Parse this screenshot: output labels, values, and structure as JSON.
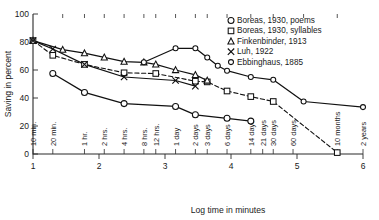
{
  "chart_data": {
    "type": "line",
    "title": "",
    "xlabel": "Log time in minutes",
    "ylabel": "Saving in percent",
    "xlim": [
      1,
      6
    ],
    "ylim": [
      0,
      100
    ],
    "grid": false,
    "legend_position": "top-right",
    "y_ticks": [
      0,
      20,
      40,
      60,
      80,
      100
    ],
    "x_ticks": [
      1,
      2,
      3,
      4,
      5,
      6
    ],
    "x_category_labels": [
      {
        "label": "10 min.",
        "log_minutes": 1.0
      },
      {
        "label": "20 min.",
        "log_minutes": 1.3
      },
      {
        "label": "1 hr.",
        "log_minutes": 1.78
      },
      {
        "label": "2 hrs.",
        "log_minutes": 2.08
      },
      {
        "label": "4 hrs.",
        "log_minutes": 2.38
      },
      {
        "label": "8 hrs.",
        "log_minutes": 2.68
      },
      {
        "label": "12 hrs.",
        "log_minutes": 2.86
      },
      {
        "label": "1 day",
        "log_minutes": 3.16
      },
      {
        "label": "2 days",
        "log_minutes": 3.46
      },
      {
        "label": "3 days",
        "log_minutes": 3.64
      },
      {
        "label": "6 days",
        "log_minutes": 3.94
      },
      {
        "label": "14 days",
        "log_minutes": 4.3
      },
      {
        "label": "21 days",
        "log_minutes": 4.48
      },
      {
        "label": "30 days",
        "log_minutes": 4.64
      },
      {
        "label": "60 days",
        "log_minutes": 4.94
      },
      {
        "label": "10 months",
        "log_minutes": 5.61
      },
      {
        "label": "2 years",
        "log_minutes": 6.0
      }
    ],
    "series": [
      {
        "name": "Boreas, 1930, poems",
        "marker": "circle",
        "line_style": "solid",
        "points": [
          {
            "x": 1.3,
            "y": 57.5
          },
          {
            "x": 1.78,
            "y": 44.0
          },
          {
            "x": 2.38,
            "y": 36.0
          },
          {
            "x": 3.16,
            "y": 34.0
          },
          {
            "x": 3.46,
            "y": 28.0
          },
          {
            "x": 3.94,
            "y": 25.5
          },
          {
            "x": 4.3,
            "y": 23.5
          }
        ]
      },
      {
        "name": "Boreas, 1930, syllables",
        "marker": "square",
        "line_style": "dashed",
        "points": [
          {
            "x": 1.0,
            "y": 81.0
          },
          {
            "x": 1.3,
            "y": 70.5
          },
          {
            "x": 1.78,
            "y": 64.0
          },
          {
            "x": 2.38,
            "y": 58.0
          },
          {
            "x": 2.86,
            "y": 57.5
          },
          {
            "x": 3.46,
            "y": 52.0
          },
          {
            "x": 3.64,
            "y": 51.5
          },
          {
            "x": 3.94,
            "y": 45.0
          },
          {
            "x": 4.3,
            "y": 41.0
          },
          {
            "x": 4.64,
            "y": 37.5
          },
          {
            "x": 5.61,
            "y": 1.0
          }
        ]
      },
      {
        "name": "Finkenbinder, 1913",
        "marker": "triangle",
        "line_style": "solid",
        "points": [
          {
            "x": 1.0,
            "y": 81.0
          },
          {
            "x": 1.45,
            "y": 74.5
          },
          {
            "x": 1.78,
            "y": 72.0
          },
          {
            "x": 2.08,
            "y": 69.0
          },
          {
            "x": 2.38,
            "y": 66.0
          },
          {
            "x": 2.68,
            "y": 65.5
          },
          {
            "x": 2.86,
            "y": 64.0
          },
          {
            "x": 3.16,
            "y": 60.0
          },
          {
            "x": 3.46,
            "y": 56.5
          },
          {
            "x": 3.64,
            "y": 52.5
          }
        ]
      },
      {
        "name": "Luh, 1922",
        "marker": "cross",
        "line_style": "solid",
        "points": [
          {
            "x": 1.0,
            "y": 81.0
          },
          {
            "x": 1.3,
            "y": 75.0
          },
          {
            "x": 1.78,
            "y": 64.0
          },
          {
            "x": 2.38,
            "y": 55.0
          },
          {
            "x": 3.16,
            "y": 52.5
          },
          {
            "x": 3.46,
            "y": 48.5
          }
        ]
      },
      {
        "name": "Ebbinghaus, 1885",
        "marker": "circle-small",
        "line_style": "solid",
        "points": [
          {
            "x": 2.68,
            "y": 65.5
          },
          {
            "x": 3.16,
            "y": 75.5
          },
          {
            "x": 3.46,
            "y": 75.5
          },
          {
            "x": 3.64,
            "y": 69.0
          },
          {
            "x": 3.8,
            "y": 63.0
          },
          {
            "x": 3.94,
            "y": 59.5
          },
          {
            "x": 4.3,
            "y": 55.0
          },
          {
            "x": 4.64,
            "y": 53.0
          },
          {
            "x": 5.1,
            "y": 37.5
          },
          {
            "x": 6.0,
            "y": 33.5
          }
        ]
      }
    ],
    "legend": [
      {
        "marker": "circle",
        "label": "Boreas, 1930, poems"
      },
      {
        "marker": "square",
        "label": "Boreas, 1930, syllables"
      },
      {
        "marker": "triangle",
        "label": "Finkenbinder, 1913"
      },
      {
        "marker": "cross",
        "label": "Luh, 1922"
      },
      {
        "marker": "circle-small",
        "label": "Ebbinghaus, 1885"
      }
    ]
  }
}
